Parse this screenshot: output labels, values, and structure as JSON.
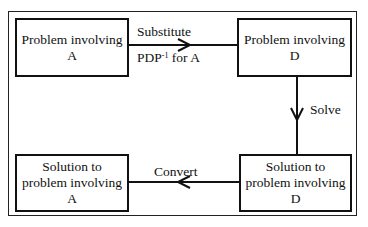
{
  "diagram": {
    "boxes": {
      "problem_a": "Problem involving\nA",
      "problem_d": "Problem involving\nD",
      "solution_d": "Solution to\nproblem involving\nD",
      "solution_a": "Solution to\nproblem involving\nA"
    },
    "edges": {
      "substitute_line1": "Substitute",
      "substitute_line2_prefix": "PDP",
      "substitute_line2_sup": "-1",
      "substitute_line2_suffix": " for A",
      "solve": "Solve",
      "convert": "Convert"
    }
  }
}
